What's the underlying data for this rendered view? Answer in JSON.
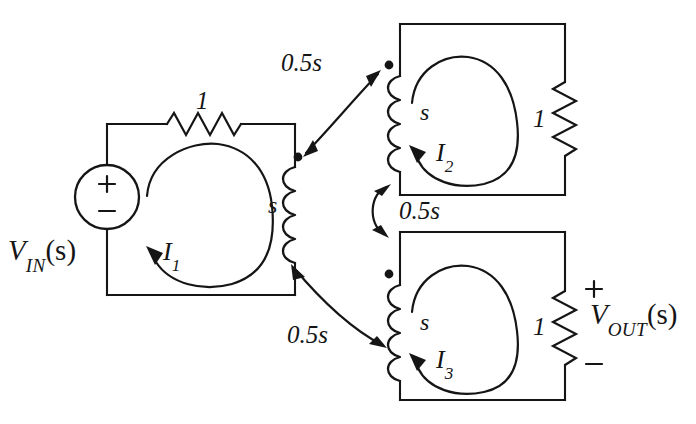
{
  "diagram": {
    "type": "circuit-schematic",
    "ink_color": "#151515",
    "background_color": "#ffffff"
  },
  "source": {
    "name": "independent-voltage-source",
    "label": "V",
    "subscript": "IN",
    "argument": "(s)",
    "plus": "+",
    "minus": "−"
  },
  "output": {
    "name": "output-voltage",
    "label": "V",
    "subscript": "OUT",
    "argument": "(s)",
    "plus": "+",
    "minus": "−"
  },
  "components": {
    "r_input": {
      "label": "1",
      "kind": "resistor",
      "orientation": "horizontal"
    },
    "l_primary": {
      "label": "s",
      "kind": "inductor",
      "orientation": "vertical"
    },
    "l_secondary_top": {
      "label": "s",
      "kind": "inductor",
      "orientation": "vertical"
    },
    "l_secondary_bottom": {
      "label": "s",
      "kind": "inductor",
      "orientation": "vertical"
    },
    "r_top": {
      "label": "1",
      "kind": "resistor",
      "orientation": "vertical"
    },
    "r_bottom": {
      "label": "1",
      "kind": "resistor",
      "orientation": "vertical"
    }
  },
  "couplings": [
    {
      "name": "coupling-primary-top",
      "label": "0.5s"
    },
    {
      "name": "coupling-top-bottom",
      "label": "0.5s"
    },
    {
      "name": "coupling-primary-bottom",
      "label": "0.5s"
    }
  ],
  "mesh_currents": [
    {
      "name": "mesh-current-1",
      "label": "I",
      "subscript": "1"
    },
    {
      "name": "mesh-current-2",
      "label": "I",
      "subscript": "2"
    },
    {
      "name": "mesh-current-3",
      "label": "I",
      "subscript": "3"
    }
  ]
}
